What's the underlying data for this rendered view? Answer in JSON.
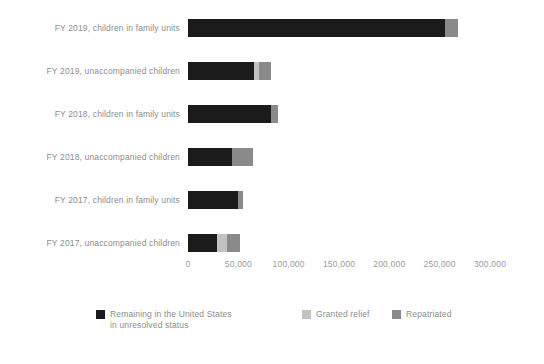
{
  "chart_data": {
    "type": "bar",
    "orientation": "horizontal",
    "stacked": true,
    "title": "",
    "subtitle": "",
    "xlabel": "",
    "ylabel": "",
    "xlim": [
      0,
      300000
    ],
    "grid": false,
    "legend_position": "bottom",
    "categories": [
      "FY 2019, children in family units",
      "FY 2019, unaccompanied children",
      "FY 2018, children in family units",
      "FY 2018, unaccompanied children",
      "FY 2017, children in family units",
      "FY 2017, unaccompanied children"
    ],
    "xticks": [
      0,
      50000,
      100000,
      150000,
      200000,
      250000,
      300000
    ],
    "xticklabels": [
      "0",
      "50,000",
      "100,000",
      "150,000",
      "200,000",
      "250,000",
      "300,000"
    ],
    "series": [
      {
        "name": "Remaining in the United States\nin unresolved status",
        "color": "#1b1b1b",
        "values": [
          255000,
          66000,
          82000,
          44000,
          50000,
          29000
        ]
      },
      {
        "name": "Granted relief",
        "color": "#c2c2c2",
        "values": [
          0,
          5000,
          0,
          0,
          0,
          10000
        ]
      },
      {
        "name": "Repatriated",
        "color": "#8a8a8a",
        "values": [
          13000,
          11000,
          7000,
          21000,
          5000,
          13000
        ]
      }
    ]
  },
  "legend": {
    "items": [
      {
        "label": "Remaining in the United States\nin unresolved status",
        "color": "#1b1b1b"
      },
      {
        "label": "Granted relief",
        "color": "#c2c2c2"
      },
      {
        "label": "Repatriated",
        "color": "#8a8a8a"
      }
    ]
  }
}
